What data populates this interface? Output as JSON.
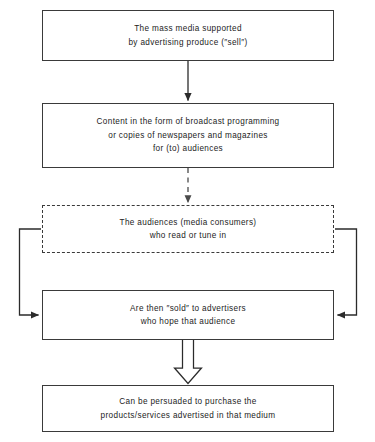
{
  "diagram": {
    "type": "flowchart",
    "background_color": "#ffffff",
    "line_color": "#3a3a3a",
    "text_color": "#1c1c1c",
    "nodes": [
      {
        "id": "media",
        "border": "solid",
        "line1": "The mass media supported",
        "line2": "by advertising produce (″sell″)"
      },
      {
        "id": "content",
        "border": "solid",
        "line1": "Content in the form of broadcast programming",
        "line2": "or copies of newspapers and magazines",
        "line3": "for (to) audiences"
      },
      {
        "id": "audiences",
        "border": "dashed",
        "line1": "The audiences (media consumers)",
        "line2": "who read or tune in"
      },
      {
        "id": "sold",
        "border": "solid",
        "line1": "Are then ″sold″ to advertisers",
        "line2": "who hope that audience"
      },
      {
        "id": "persuaded",
        "border": "solid",
        "line1": "Can be persuaded to purchase the",
        "line2": "products/services advertised in that medium"
      }
    ],
    "connectors": [
      {
        "id": "media-to-content",
        "style": "solid-arrow",
        "from": "media",
        "to": "content"
      },
      {
        "id": "content-to-audiences",
        "style": "dashed-arrow",
        "from": "content",
        "to": "audiences"
      },
      {
        "id": "audiences-left-to-sold",
        "style": "solid-elbow-arrow",
        "from": "audiences",
        "to": "sold"
      },
      {
        "id": "audiences-right-to-sold",
        "style": "solid-elbow-arrow",
        "from": "audiences",
        "to": "sold"
      },
      {
        "id": "sold-to-persuaded",
        "style": "hollow-block-arrow",
        "from": "sold",
        "to": "persuaded"
      }
    ]
  }
}
